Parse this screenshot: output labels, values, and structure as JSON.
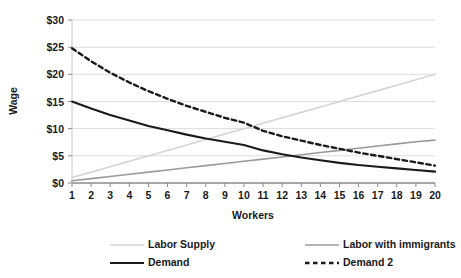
{
  "chart_data": {
    "type": "line",
    "title": "",
    "xlabel": "Workers",
    "ylabel": "Wage",
    "xlim": [
      1,
      20
    ],
    "ylim": [
      0,
      30
    ],
    "grid": true,
    "legend_position": "bottom",
    "x": [
      1,
      2,
      3,
      4,
      5,
      6,
      7,
      8,
      9,
      10,
      11,
      12,
      13,
      14,
      15,
      16,
      17,
      18,
      19,
      20
    ],
    "xtick_labels": [
      "1",
      "2",
      "3",
      "4",
      "5",
      "6",
      "7",
      "8",
      "9",
      "10",
      "11",
      "12",
      "13",
      "14",
      "15",
      "16",
      "17",
      "18",
      "19",
      "20"
    ],
    "ytick_labels": [
      "$0",
      "$5",
      "$10",
      "$15",
      "$20",
      "$25",
      "$30"
    ],
    "ytick_values": [
      0,
      5,
      10,
      15,
      20,
      25,
      30
    ],
    "series": [
      {
        "name": "Labor Supply",
        "color": "#d4d4d4",
        "style": "solid",
        "width": 1.6,
        "values": [
          1.0,
          2.0,
          3.0,
          4.0,
          5.0,
          6.0,
          7.0,
          8.0,
          9.0,
          10.0,
          11.0,
          12.0,
          13.0,
          14.0,
          15.0,
          16.0,
          17.0,
          18.0,
          19.0,
          20.0
        ]
      },
      {
        "name": "Labor with immigrants",
        "color": "#9a9a9a",
        "style": "solid",
        "width": 1.6,
        "values": [
          0.4,
          0.8,
          1.2,
          1.6,
          2.0,
          2.4,
          2.8,
          3.2,
          3.6,
          4.0,
          4.4,
          4.8,
          5.2,
          5.6,
          6.0,
          6.4,
          6.8,
          7.2,
          7.6,
          7.9
        ]
      },
      {
        "name": "Demand",
        "color": "#1a1a1a",
        "style": "solid",
        "width": 2.1,
        "values": [
          15.0,
          13.7,
          12.5,
          11.5,
          10.5,
          9.7,
          8.9,
          8.2,
          7.6,
          7.0,
          6.0,
          5.3,
          4.7,
          4.2,
          3.7,
          3.3,
          3.0,
          2.7,
          2.4,
          2.1
        ]
      },
      {
        "name": "Demand 2",
        "color": "#1a1a1a",
        "style": "dashed",
        "width": 2.4,
        "values": [
          24.8,
          22.4,
          20.3,
          18.5,
          16.9,
          15.5,
          14.2,
          13.1,
          12.0,
          11.1,
          9.6,
          8.6,
          7.8,
          7.0,
          6.3,
          5.6,
          5.0,
          4.4,
          3.8,
          3.2
        ]
      }
    ]
  },
  "legend": {
    "entries": [
      {
        "label": "Labor Supply"
      },
      {
        "label": "Labor with immigrants"
      },
      {
        "label": "Demand"
      },
      {
        "label": "Demand 2"
      }
    ]
  }
}
